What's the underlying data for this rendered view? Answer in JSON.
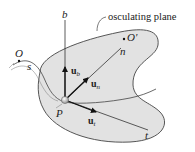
{
  "diagram": {
    "title_label": "osculating plane",
    "colors": {
      "plane_fill": "#e2e2e2",
      "stroke": "#333333",
      "text": "#222222",
      "background": "#ffffff"
    },
    "points": {
      "origin": {
        "label": "O"
      },
      "point": {
        "label": "P"
      },
      "center_of_curvature": {
        "label": "O'"
      }
    },
    "axes": {
      "binormal": {
        "label": "b"
      },
      "normal": {
        "label": "n"
      },
      "tangent": {
        "label": "t"
      }
    },
    "unit_vectors": {
      "binormal": {
        "base": "u",
        "sub": "b"
      },
      "normal": {
        "base": "u",
        "sub": "n"
      },
      "tangent": {
        "base": "u",
        "sub": "t"
      }
    },
    "path_coordinate": {
      "label": "s"
    }
  }
}
